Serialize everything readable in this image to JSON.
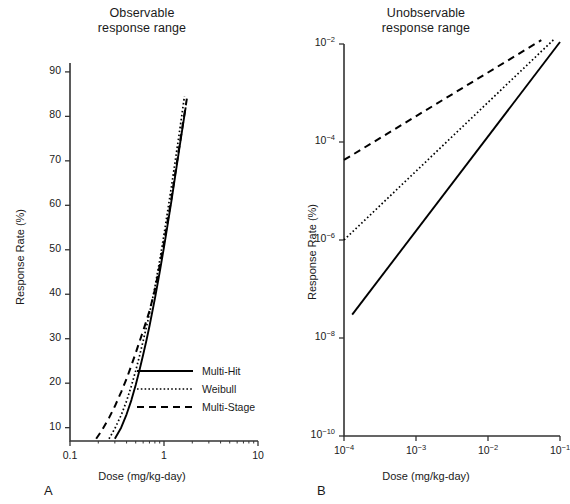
{
  "figure": {
    "panels": [
      {
        "letter": "A",
        "title_line1": "Observable",
        "title_line2": "response range",
        "xlabel": "Dose (mg/kg-day)",
        "ylabel": "Response Rate (%)"
      },
      {
        "letter": "B",
        "title_line1": "Unobservable",
        "title_line2": "response range",
        "xlabel": "Dose (mg/kg-day)",
        "ylabel": "Response Rate (%)"
      }
    ],
    "legend": [
      {
        "label": "Multi-Hit",
        "style": "solid"
      },
      {
        "label": "Weibull",
        "style": "dotted"
      },
      {
        "label": "Multi-Stage",
        "style": "dashed"
      }
    ]
  },
  "chart_data": [
    {
      "type": "line",
      "panel": "A",
      "title": "Observable response range",
      "xlabel": "Dose (mg/kg-day)",
      "ylabel": "Response Rate (%)",
      "xscale": "log",
      "yscale": "linear",
      "xlim": [
        0.1,
        10
      ],
      "ylim": [
        7,
        92
      ],
      "xticks": [
        0.1,
        1,
        10
      ],
      "xticklabels": [
        "0.1",
        "1",
        "10"
      ],
      "yticks": [
        10,
        20,
        30,
        40,
        50,
        60,
        70,
        80,
        90
      ],
      "yticklabels": [
        "10",
        "20",
        "30",
        "40",
        "50",
        "60",
        "70",
        "80",
        "90"
      ],
      "grid": false,
      "legend_position": "lower-right-inside",
      "series": [
        {
          "name": "Multi-Hit",
          "style": "solid",
          "x": [
            0.3,
            0.35,
            0.4,
            0.45,
            0.5,
            0.55,
            0.6,
            0.65,
            0.7,
            0.8,
            0.9,
            1.0,
            1.2,
            1.45,
            1.7
          ],
          "y": [
            7.5,
            10.0,
            13.0,
            16.2,
            19.6,
            23.0,
            26.4,
            29.6,
            32.8,
            39.0,
            45.0,
            50.6,
            61.0,
            72.5,
            82.0
          ]
        },
        {
          "name": "Weibull",
          "style": "dotted",
          "x": [
            0.26,
            0.3,
            0.35,
            0.4,
            0.45,
            0.5,
            0.55,
            0.6,
            0.65,
            0.7,
            0.8,
            0.9,
            1.0,
            1.2,
            1.45,
            1.65
          ],
          "y": [
            7.5,
            9.8,
            12.8,
            16.0,
            19.4,
            22.8,
            26.2,
            29.5,
            32.6,
            35.6,
            41.6,
            47.6,
            53.4,
            64.2,
            76.0,
            84.5
          ]
        },
        {
          "name": "Multi-Stage",
          "style": "dashed",
          "x": [
            0.19,
            0.22,
            0.26,
            0.3,
            0.35,
            0.4,
            0.45,
            0.5,
            0.55,
            0.6,
            0.65,
            0.7,
            0.8,
            0.9,
            1.0,
            1.2,
            1.45,
            1.75
          ],
          "y": [
            7.5,
            9.5,
            12.2,
            14.8,
            18.0,
            21.0,
            24.0,
            26.8,
            29.4,
            31.8,
            34.0,
            36.2,
            41.0,
            46.4,
            51.6,
            61.6,
            73.0,
            84.0
          ]
        }
      ]
    },
    {
      "type": "line",
      "panel": "B",
      "title": "Unobservable response range",
      "xlabel": "Dose (mg/kg-day)",
      "ylabel": "Response Rate (%)",
      "xscale": "log",
      "yscale": "log",
      "xlim": [
        0.0001,
        0.1
      ],
      "ylim": [
        1e-10,
        0.01
      ],
      "xticks": [
        0.0001,
        0.001,
        0.01,
        0.1
      ],
      "xticklabels": [
        "10-4",
        "10-3",
        "10-2",
        "10-1"
      ],
      "yticks": [
        0.01,
        0.0001,
        1e-06,
        1e-08,
        1e-10
      ],
      "yticklabels": [
        "10-2",
        "10-4",
        "10-6",
        "10-8",
        "10-10"
      ],
      "grid": false,
      "series": [
        {
          "name": "Multi-Hit",
          "style": "solid",
          "x": [
            0.00013,
            0.1
          ],
          "y": [
            3e-08,
            0.011
          ]
        },
        {
          "name": "Weibull",
          "style": "dotted",
          "x": [
            0.0001,
            0.085
          ],
          "y": [
            1e-06,
            0.013
          ]
        },
        {
          "name": "Multi-Stage",
          "style": "dashed",
          "x": [
            0.0001,
            0.055
          ],
          "y": [
            4.3e-05,
            0.012
          ]
        }
      ]
    }
  ]
}
